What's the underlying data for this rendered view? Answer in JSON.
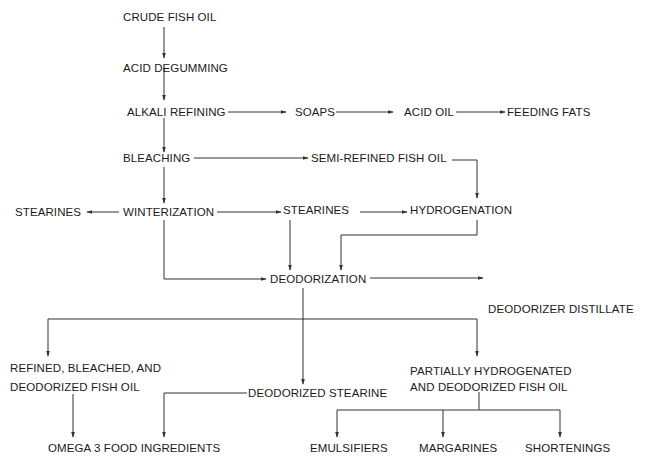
{
  "diagram": {
    "type": "flowchart",
    "nodes": {
      "crude_fish_oil": "CRUDE FISH OIL",
      "acid_degumming": "ACID DEGUMMING",
      "alkali_refining": "ALKALI REFINING",
      "soaps": "SOAPS",
      "acid_oil": "ACID OIL",
      "feeding_fats": "FEEDING FATS",
      "bleaching": "BLEACHING",
      "semi_refined_fish_oil": "SEMI-REFINED FISH OIL",
      "stearines_left": "STEARINES",
      "winterization": "WINTERIZATION",
      "stearines_right": "STEARINES",
      "hydrogenation": "HYDROGENATION",
      "deodorization": "DEODORIZATION",
      "deodorizer_distillate": "DEODORIZER DISTILLATE",
      "rbd_line1": "REFINED, BLEACHED, AND",
      "rbd_line2": "DEODORIZED FISH OIL",
      "deodorized_stearine": "DEODORIZED STEARINE",
      "phd_line1": "PARTIALLY HYDROGENATED",
      "phd_line2": "AND DEODORIZED FISH OIL",
      "omega3": "OMEGA 3 FOOD INGREDIENTS",
      "emulsifiers": "EMULSIFIERS",
      "margarines": "MARGARINES",
      "shortenings": "SHORTENINGS"
    },
    "edges": [
      [
        "CRUDE FISH OIL",
        "ACID DEGUMMING"
      ],
      [
        "ACID DEGUMMING",
        "ALKALI REFINING"
      ],
      [
        "ALKALI REFINING",
        "SOAPS"
      ],
      [
        "SOAPS",
        "ACID OIL"
      ],
      [
        "ACID OIL",
        "FEEDING FATS"
      ],
      [
        "ALKALI REFINING",
        "BLEACHING"
      ],
      [
        "BLEACHING",
        "SEMI-REFINED FISH OIL"
      ],
      [
        "SEMI-REFINED FISH OIL",
        "HYDROGENATION"
      ],
      [
        "BLEACHING",
        "WINTERIZATION"
      ],
      [
        "WINTERIZATION",
        "STEARINES (left)"
      ],
      [
        "WINTERIZATION",
        "STEARINES (right)"
      ],
      [
        "STEARINES (right)",
        "HYDROGENATION"
      ],
      [
        "STEARINES (right)",
        "DEODORIZATION"
      ],
      [
        "HYDROGENATION",
        "DEODORIZATION"
      ],
      [
        "WINTERIZATION",
        "DEODORIZATION"
      ],
      [
        "DEODORIZATION",
        "DEODORIZER DISTILLATE"
      ],
      [
        "DEODORIZATION",
        "REFINED, BLEACHED, AND DEODORIZED FISH OIL"
      ],
      [
        "DEODORIZATION",
        "DEODORIZED STEARINE"
      ],
      [
        "DEODORIZATION",
        "PARTIALLY HYDROGENATED AND DEODORIZED FISH OIL"
      ],
      [
        "REFINED, BLEACHED, AND DEODORIZED FISH OIL",
        "OMEGA 3 FOOD INGREDIENTS"
      ],
      [
        "DEODORIZED STEARINE",
        "OMEGA 3 FOOD INGREDIENTS"
      ],
      [
        "PARTIALLY HYDROGENATED AND DEODORIZED FISH OIL",
        "EMULSIFIERS"
      ],
      [
        "PARTIALLY HYDROGENATED AND DEODORIZED FISH OIL",
        "MARGARINES"
      ],
      [
        "PARTIALLY HYDROGENATED AND DEODORIZED FISH OIL",
        "SHORTENINGS"
      ]
    ],
    "colors": {
      "line": "#333333",
      "text": "#1a1a1a",
      "background": "#ffffff"
    }
  }
}
